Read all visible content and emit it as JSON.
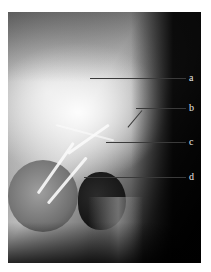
{
  "figure": {
    "type": "radiograph",
    "labels": [
      {
        "id": "a",
        "text": "a"
      },
      {
        "id": "b",
        "text": "b"
      },
      {
        "id": "c",
        "text": "c"
      },
      {
        "id": "d",
        "text": "d"
      }
    ]
  }
}
